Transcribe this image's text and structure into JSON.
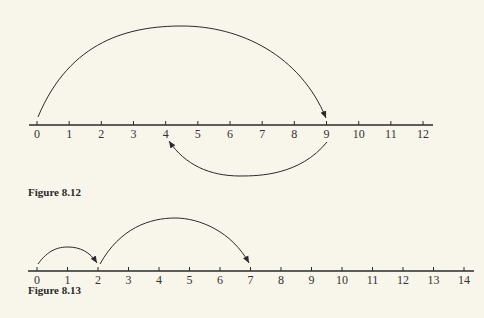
{
  "figures": [
    {
      "caption": "Figure 8.12",
      "number_line": {
        "min": 0,
        "max": 12,
        "tick_labels": [
          "0",
          "1",
          "2",
          "3",
          "4",
          "5",
          "6",
          "7",
          "8",
          "9",
          "10",
          "11",
          "12"
        ]
      },
      "jumps": [
        {
          "from": 0,
          "to": 9,
          "direction": "forward",
          "side": "above"
        },
        {
          "from": 9,
          "to": 4,
          "direction": "backward",
          "side": "below"
        }
      ]
    },
    {
      "caption": "Figure 8.13",
      "number_line": {
        "min": 0,
        "max": 14,
        "tick_labels": [
          "0",
          "1",
          "2",
          "3",
          "4",
          "5",
          "6",
          "7",
          "8",
          "9",
          "10",
          "11",
          "12",
          "13",
          "14"
        ]
      },
      "jumps": [
        {
          "from": 0,
          "to": 2,
          "direction": "forward",
          "side": "above"
        },
        {
          "from": 2,
          "to": 7,
          "direction": "forward",
          "side": "above"
        }
      ]
    }
  ],
  "colors": {
    "background": "#f8f5ea",
    "ink": "#2a2a2a"
  }
}
